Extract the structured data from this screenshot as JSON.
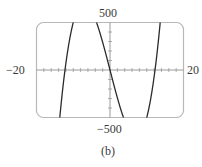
{
  "chart_data": {
    "type": "line",
    "title": "",
    "caption": "(b)",
    "xlabel": "",
    "ylabel": "",
    "xlim": [
      -20,
      20
    ],
    "ylim": [
      -500,
      500
    ],
    "x_tick_step": 2,
    "y_tick_step": 100,
    "grid": false,
    "legend": null,
    "axis_labels": {
      "x_min": "−20",
      "x_max": "20",
      "y_max": "500",
      "y_min": "−500"
    },
    "function": "y = x^3 - 150x",
    "series": [
      {
        "name": "curve",
        "x": [
          -20,
          -15,
          -13,
          -12.25,
          -12,
          -11,
          -10,
          -8,
          -7.07,
          -5,
          -3,
          0,
          3,
          5,
          7.07,
          8,
          10,
          12,
          12.25,
          13,
          14,
          15
        ],
        "y": [
          -5000,
          -1125,
          -247,
          0,
          72,
          319,
          500,
          688,
          707,
          625,
          423,
          0,
          -423,
          -625,
          -707,
          -688,
          -500,
          -72,
          0,
          247,
          644,
          1125
        ]
      }
    ],
    "roots": [
      -12.25,
      0,
      12.25
    ],
    "frame_style": "rounded-rectangle"
  },
  "labels": {
    "x_min": "−20",
    "x_max": "20",
    "y_max": "500",
    "y_min": "−500",
    "caption": "(b)"
  },
  "colors": {
    "frame": "#b8b8b8",
    "axis": "#9a9a9a",
    "curve": "#2a2a2a",
    "text": "#3a3a3a"
  }
}
